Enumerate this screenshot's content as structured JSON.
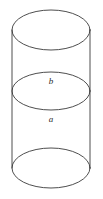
{
  "figure": {
    "kind": "cylinder-line-drawing",
    "width": 103,
    "height": 199,
    "background_color": "#ffffff",
    "stroke_color": "#3a3a3a",
    "stroke_width": 0.9,
    "fill": "none"
  },
  "geometry": {
    "axis_center_x": 51,
    "left_side_x": 12,
    "right_side_x": 90,
    "ellipse_rx": 39,
    "top_ellipse": {
      "cx": 51,
      "cy": 30,
      "rx": 39,
      "ry": 20
    },
    "middle_ellipse": {
      "cx": 51,
      "cy": 91,
      "rx": 39,
      "ry": 19
    },
    "bottom_ellipse": {
      "cx": 51,
      "cy": 168,
      "rx": 39,
      "ry": 20
    },
    "left_wall": {
      "x1": 12,
      "y1": 30,
      "x2": 12,
      "y2": 168
    },
    "right_wall": {
      "x1": 90,
      "y1": 30,
      "x2": 90,
      "y2": 168
    }
  },
  "labels": {
    "upper": {
      "text": "b",
      "x": 51,
      "y": 84
    },
    "lower": {
      "text": "a",
      "x": 51,
      "y": 122
    }
  }
}
